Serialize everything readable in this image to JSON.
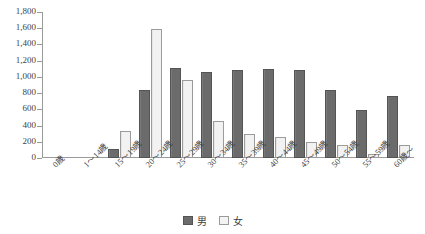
{
  "chart_data": {
    "type": "bar",
    "title": "",
    "xlabel": "",
    "ylabel": "",
    "ylim": [
      0,
      1800
    ],
    "ytick_step": 200,
    "grid": false,
    "legend_position": "bottom-center",
    "categories": [
      "0歳",
      "1〜14歳",
      "15〜19歳",
      "20〜24歳",
      "25〜29歳",
      "30〜34歳",
      "35〜39歳",
      "40〜44歳",
      "45〜49歳",
      "50〜54歳",
      "55〜59歳",
      "60歳〜"
    ],
    "series": [
      {
        "name": "男",
        "color": "#6b6b6b",
        "values": [
          0,
          0,
          110,
          835,
          1110,
          1055,
          1085,
          1095,
          1080,
          840,
          590,
          765
        ]
      },
      {
        "name": "女",
        "color": "#f2f2f2",
        "values": [
          0,
          0,
          335,
          1590,
          965,
          455,
          300,
          260,
          200,
          155,
          50,
          155
        ]
      }
    ],
    "ytick_labels": [
      "1,800",
      "1,600",
      "1,400",
      "1,200",
      "1,000",
      "800",
      "600",
      "400",
      "200",
      "0"
    ],
    "ytick_values": [
      1800,
      1600,
      1400,
      1200,
      1000,
      800,
      600,
      400,
      200,
      0
    ]
  },
  "legend": {
    "items": [
      {
        "label": "男",
        "swatch": "male"
      },
      {
        "label": "女",
        "swatch": "female"
      }
    ]
  }
}
